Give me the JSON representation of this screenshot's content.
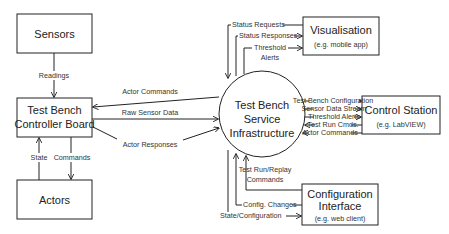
{
  "diagram": {
    "nodes": {
      "sensors": {
        "title": "Sensors"
      },
      "controller": {
        "title_line1": "Test Bench",
        "title_line2": "Controller Board"
      },
      "actors": {
        "title": "Actors"
      },
      "service": {
        "line1": "Test Bench",
        "line2": "Service",
        "line3": "Infrastructure"
      },
      "visualisation": {
        "title": "Visualisation",
        "subtitle": "(e.g. mobile app)"
      },
      "control_station": {
        "title": "Control Station",
        "subtitle": "(e.g. LabVIEW)"
      },
      "config_interface": {
        "title_line1": "Configuration",
        "title_line2": "Interface",
        "subtitle": "(e.g. web client)"
      }
    },
    "edges": {
      "readings": "Readings",
      "state": "State",
      "commands": "Commands",
      "actor_commands_left": "Actor Commands",
      "raw_sensor_data": "Raw Sensor Data",
      "actor_responses": "Actor Responses",
      "status_requests": "Status Requests",
      "status_responses": "Status Responses",
      "threshold_alerts_top_1": "Threshold",
      "threshold_alerts_top_2": "Alerts",
      "tb_configuration": "Test Bench Configuration",
      "sensor_data_stream": "Sensor Data Stream",
      "threshold_alerts_right": "Threshold Alerts",
      "test_run_cmds": "Test Run Cmds.",
      "actor_commands_right": "Actor Commands",
      "test_run_replay_1": "Test Run/Replay",
      "test_run_replay_2": "Commands",
      "config_changes": "Config. Changes",
      "state_configuration": "State/Configuration"
    }
  }
}
